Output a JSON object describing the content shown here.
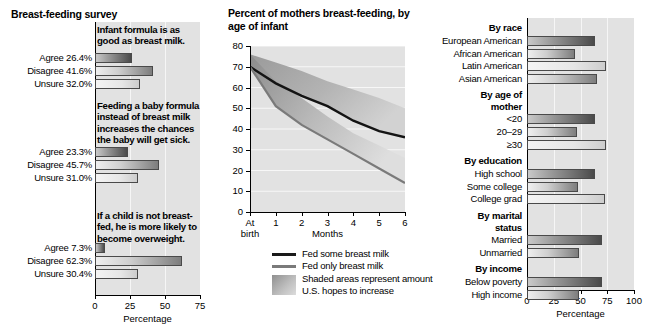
{
  "left": {
    "title": "Breast-feeding survey",
    "axis_title": "Percentage",
    "ticks": [
      "0",
      "25",
      "50",
      "75"
    ],
    "xlim": [
      0,
      75
    ],
    "questions": [
      {
        "text": "Infant formula is as good as breast milk.",
        "rows": [
          {
            "label": "Agree 26.4%",
            "value": 26.4,
            "shade": "dark"
          },
          {
            "label": "Disagree 41.6%",
            "value": 41.6,
            "shade": "mid"
          },
          {
            "label": "Unsure 32.0%",
            "value": 32.0,
            "shade": "light"
          }
        ]
      },
      {
        "text": "Feeding a baby formula instead of breast milk increases the chances the baby will get sick.",
        "rows": [
          {
            "label": "Agree 23.3%",
            "value": 23.3,
            "shade": "dark"
          },
          {
            "label": "Disagree 45.7%",
            "value": 45.7,
            "shade": "mid"
          },
          {
            "label": "Unsure 31.0%",
            "value": 31.0,
            "shade": "light"
          }
        ]
      },
      {
        "text": "If a child is not breast-fed, he is more likely to become overweight.",
        "rows": [
          {
            "label": "Agree 7.3%",
            "value": 7.3,
            "shade": "dark"
          },
          {
            "label": "Disagree 62.3%",
            "value": 62.3,
            "shade": "mid"
          },
          {
            "label": "Unsure 30.4%",
            "value": 30.4,
            "shade": "light"
          }
        ]
      }
    ]
  },
  "middle": {
    "title": "Percent of mothers breast-feeding, by age of infant",
    "legend": [
      {
        "label": "Fed some breast milk",
        "marker": "line-black",
        "color": "#1a1a1a"
      },
      {
        "label": "Fed only breast milk",
        "marker": "line-gray",
        "color": "#7a7a7a"
      },
      {
        "label": "Shaded areas represent amount",
        "marker": "swatch"
      },
      {
        "label": "U.S. hopes to increase",
        "marker": "none"
      }
    ]
  },
  "right": {
    "axis_title": "Percentage",
    "ticks": [
      "0",
      "25",
      "50",
      "75",
      "100"
    ],
    "xlim": [
      0,
      100
    ],
    "groups": [
      {
        "heading": "By race",
        "rows": [
          {
            "label": "European American",
            "value": 64,
            "shade": "dark"
          },
          {
            "label": "African American",
            "value": 45,
            "shade": "mid"
          },
          {
            "label": "Latin American",
            "value": 74,
            "shade": "light"
          },
          {
            "label": "Asian American",
            "value": 65,
            "shade": "mid"
          }
        ]
      },
      {
        "heading": "By age of mother",
        "rows": [
          {
            "label": "<20",
            "value": 64,
            "shade": "dark"
          },
          {
            "label": "20–29",
            "value": 47,
            "shade": "mid"
          },
          {
            "label": "≥30",
            "value": 74,
            "shade": "light"
          }
        ]
      },
      {
        "heading": "By education",
        "rows": [
          {
            "label": "High school",
            "value": 64,
            "shade": "dark"
          },
          {
            "label": "Some college",
            "value": 48,
            "shade": "mid"
          },
          {
            "label": "College grad",
            "value": 73,
            "shade": "light"
          }
        ]
      },
      {
        "heading": "By marital status",
        "rows": [
          {
            "label": "Married",
            "value": 70,
            "shade": "dark"
          },
          {
            "label": "Unmarried",
            "value": 49,
            "shade": "mid"
          }
        ]
      },
      {
        "heading": "By income",
        "rows": [
          {
            "label": "Below poverty",
            "value": 70,
            "shade": "dark"
          },
          {
            "label": "High income",
            "value": 49,
            "shade": "mid"
          }
        ]
      }
    ]
  },
  "chart_data": [
    {
      "type": "bar",
      "title": "Breast-feeding survey",
      "xlabel": "Percentage",
      "ylabel": "",
      "xlim": [
        0,
        75
      ],
      "orientation": "horizontal",
      "panels": [
        {
          "question": "Infant formula is as good as breast milk.",
          "categories": [
            "Agree",
            "Disagree",
            "Unsure"
          ],
          "values": [
            26.4,
            41.6,
            32.0
          ]
        },
        {
          "question": "Feeding a baby formula instead of breast milk increases the chances the baby will get sick.",
          "categories": [
            "Agree",
            "Disagree",
            "Unsure"
          ],
          "values": [
            23.3,
            45.7,
            31.0
          ]
        },
        {
          "question": "If a child is not breast-fed, he is more likely to become overweight.",
          "categories": [
            "Agree",
            "Disagree",
            "Unsure"
          ],
          "values": [
            7.3,
            62.3,
            30.4
          ]
        }
      ]
    },
    {
      "type": "area",
      "title": "Percent of mothers breast-feeding, by age of infant",
      "xlabel": "Months",
      "ylabel": "",
      "x": [
        "At birth",
        "1",
        "2",
        "3",
        "4",
        "5",
        "6"
      ],
      "xlim": [
        0,
        6
      ],
      "ylim": [
        0,
        80
      ],
      "yticks": [
        0,
        10,
        20,
        30,
        40,
        50,
        60,
        70,
        80
      ],
      "grid": "horizontal",
      "legend_position": "below",
      "series": [
        {
          "name": "Fed some breast milk",
          "values": [
            70,
            62,
            56,
            51,
            44,
            39,
            36
          ]
        },
        {
          "name": "Fed only breast milk",
          "values": [
            70,
            51,
            42,
            35,
            28,
            21,
            14
          ]
        },
        {
          "name": "U.S. goal: fed some breast milk",
          "values": [
            76,
            72,
            68,
            63,
            59,
            55,
            50
          ]
        },
        {
          "name": "U.S. goal: fed only breast milk",
          "values": [
            76,
            63,
            55,
            46,
            38,
            32,
            26
          ]
        }
      ],
      "annotation": "Shaded areas represent amount U.S. hopes to increase"
    },
    {
      "type": "bar",
      "title": "",
      "xlabel": "Percentage",
      "xlim": [
        0,
        100
      ],
      "orientation": "horizontal",
      "groups": [
        {
          "heading": "By race",
          "categories": [
            "European American",
            "African American",
            "Latin American",
            "Asian American"
          ],
          "values": [
            64,
            45,
            74,
            65
          ]
        },
        {
          "heading": "By age of mother",
          "categories": [
            "<20",
            "20–29",
            "≥30"
          ],
          "values": [
            64,
            47,
            74
          ]
        },
        {
          "heading": "By education",
          "categories": [
            "High school",
            "Some college",
            "College grad"
          ],
          "values": [
            64,
            48,
            73
          ]
        },
        {
          "heading": "By marital status",
          "categories": [
            "Married",
            "Unmarried"
          ],
          "values": [
            70,
            49
          ]
        },
        {
          "heading": "By income",
          "categories": [
            "Below poverty",
            "High income"
          ],
          "values": [
            70,
            49
          ]
        }
      ]
    }
  ]
}
